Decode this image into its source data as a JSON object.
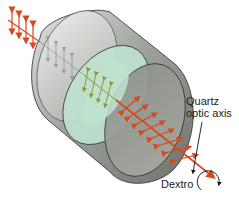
{
  "diagram": {
    "labels": {
      "axis_line1": "Quartz",
      "axis_line2": "optic axis",
      "rotation": "Dextro"
    },
    "colors": {
      "light_ray": "#d9471c",
      "inner_ray": "#9aa63a",
      "cylinder_body": "#9a9e98",
      "cylinder_front_face": "#a9ae9f",
      "cylinder_back_face": "#cfd6d0",
      "cross_section": "#bfe3cf",
      "outline": "#2e2e2e",
      "label_text": "#222222"
    },
    "elements": [
      "incident polarized light (vertical E-field)",
      "quartz cylinder",
      "internal cross-section plane (rotated polarization)",
      "exit polarized light (rotated E-field)",
      "optic axis pointer",
      "dextrorotatory rotation arrow"
    ]
  }
}
